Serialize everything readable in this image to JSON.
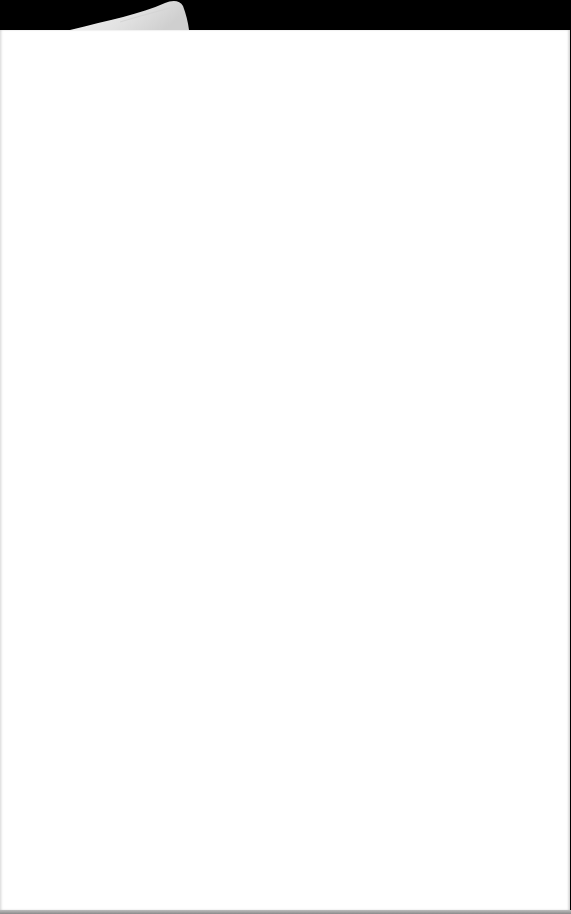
{
  "scene": {
    "description": "Blank white sheet of paper on a black background with a curled corner at the top edge",
    "colors": {
      "background": "#000000",
      "paper": "#ffffff",
      "curl": "#e6e6e6"
    }
  }
}
